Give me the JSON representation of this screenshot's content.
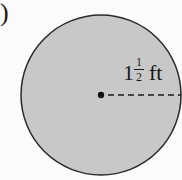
{
  "figure": {
    "part_label": ")",
    "shape": "circle",
    "fill_color": "#c8c8c8",
    "stroke_color": "#2a2a2a",
    "radius_label": {
      "whole": "1",
      "numerator": "1",
      "denominator": "2",
      "unit": "ft"
    }
  }
}
